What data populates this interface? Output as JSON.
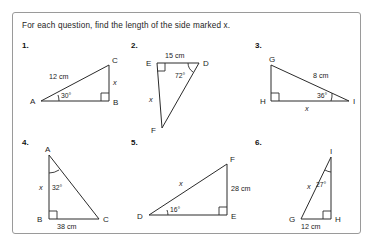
{
  "worksheet": {
    "instruction": "For each question, find the length of the side marked x.",
    "unknown_symbol": "x",
    "border_color": "#9a9a9a",
    "ink_color": "#2b2b2b"
  },
  "questions": [
    {
      "number": "1.",
      "vertices": [
        "A",
        "B",
        "C"
      ],
      "right_angle_at": "B",
      "angle": {
        "at": "A",
        "value": "30°"
      },
      "given_side": {
        "label": "12 cm",
        "between": "AC"
      },
      "unknown_side": {
        "label": "x",
        "between": "BC"
      },
      "labels": {
        "A": "A",
        "B": "B",
        "C": "C",
        "side_given": "12 cm",
        "side_unknown": "x",
        "angle": "30°"
      }
    },
    {
      "number": "2.",
      "vertices": [
        "D",
        "E",
        "F"
      ],
      "right_angle_at": "E",
      "angle": {
        "at": "D",
        "value": "72°"
      },
      "given_side": {
        "label": "15 cm",
        "between": "ED"
      },
      "unknown_side": {
        "label": "x",
        "between": "EF"
      },
      "labels": {
        "D": "D",
        "E": "E",
        "F": "F",
        "side_given": "15 cm",
        "side_unknown": "x",
        "angle": "72°"
      }
    },
    {
      "number": "3.",
      "vertices": [
        "G",
        "H",
        "I"
      ],
      "right_angle_at": "H",
      "angle": {
        "at": "I",
        "value": "36°"
      },
      "given_side": {
        "label": "8 cm",
        "between": "GI"
      },
      "unknown_side": {
        "label": "x",
        "between": "HI"
      },
      "labels": {
        "G": "G",
        "H": "H",
        "I": "I",
        "side_given": "8 cm",
        "side_unknown": "x",
        "angle": "36°"
      }
    },
    {
      "number": "4.",
      "vertices": [
        "A",
        "B",
        "C"
      ],
      "right_angle_at": "B",
      "angle": {
        "at": "A",
        "value": "32°"
      },
      "given_side": {
        "label": "38 cm",
        "between": "BC"
      },
      "unknown_side": {
        "label": "x",
        "between": "AB"
      },
      "labels": {
        "A": "A",
        "B": "B",
        "C": "C",
        "side_given": "38 cm",
        "side_unknown": "x",
        "angle": "32°"
      }
    },
    {
      "number": "5.",
      "vertices": [
        "D",
        "E",
        "F"
      ],
      "right_angle_at": "E",
      "angle": {
        "at": "D",
        "value": "16°"
      },
      "given_side": {
        "label": "28 cm",
        "between": "FE"
      },
      "unknown_side": {
        "label": "x",
        "between": "DF"
      },
      "labels": {
        "D": "D",
        "E": "E",
        "F": "F",
        "side_given": "28 cm",
        "side_unknown": "x",
        "angle": "16°"
      }
    },
    {
      "number": "6.",
      "vertices": [
        "G",
        "H",
        "I"
      ],
      "right_angle_at": "H",
      "angle": {
        "at": "I",
        "value": "27°"
      },
      "given_side": {
        "label": "12 cm",
        "between": "GH"
      },
      "unknown_side": {
        "label": "x",
        "between": "IG"
      },
      "labels": {
        "G": "G",
        "H": "H",
        "I": "I",
        "side_given": "12 cm",
        "side_unknown": "x",
        "angle": "27°"
      }
    }
  ]
}
